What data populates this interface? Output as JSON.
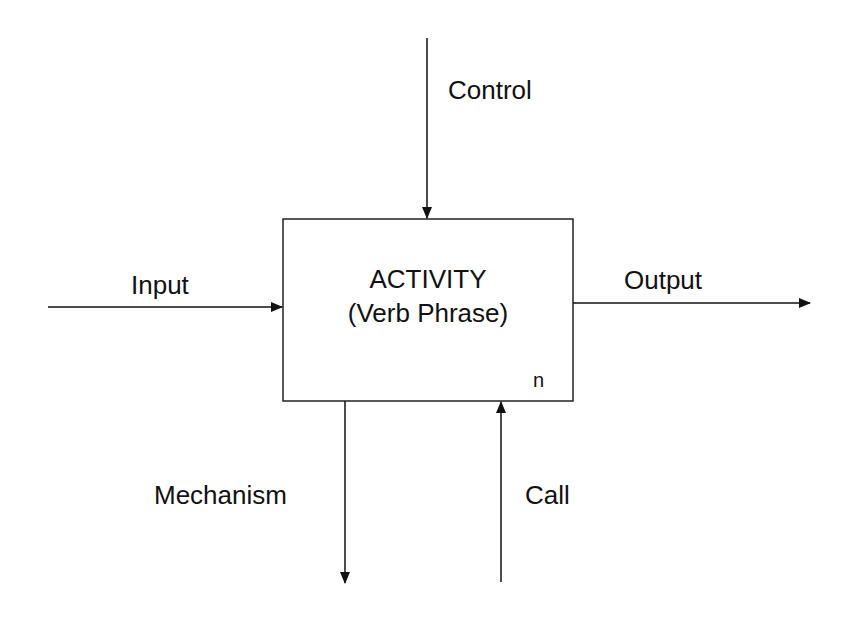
{
  "diagram": {
    "type": "IDEF0 activity box",
    "activity": {
      "title": "ACTIVITY",
      "subtitle": "(Verb Phrase)",
      "node_number": "n"
    },
    "arrows": {
      "control": {
        "label": "Control",
        "direction": "down-into-top"
      },
      "input": {
        "label": "Input",
        "direction": "right-into-left"
      },
      "output": {
        "label": "Output",
        "direction": "right-out-of-right"
      },
      "mechanism": {
        "label": "Mechanism",
        "direction": "down-out-of-bottom"
      },
      "call": {
        "label": "Call",
        "direction": "up-into-bottom"
      }
    },
    "colors": {
      "line": "#111111",
      "background": "#ffffff"
    }
  }
}
